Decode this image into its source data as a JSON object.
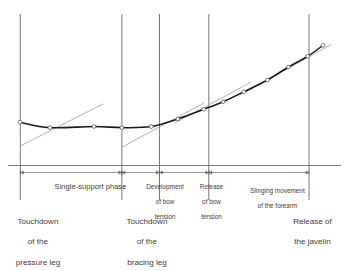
{
  "figure": {
    "colors": {
      "curve": "#1a1a1a",
      "tangent": "#9a9a9a",
      "axis": "#6b6b6b",
      "divider": "#6b6b6b",
      "text": "#3d3d3d",
      "marker_fill": "#ffffff",
      "background": "#ffffff"
    }
  },
  "chart_data": {
    "type": "line",
    "title": "",
    "xlabel": "",
    "ylabel": "",
    "xlim": [
      0,
      100
    ],
    "ylim": [
      0,
      100
    ],
    "grid": false,
    "legend": "none",
    "series": [
      {
        "name": "javelin velocity",
        "marker": "open-circle",
        "points": [
          {
            "x": 3.6,
            "y": 28.6
          },
          {
            "x": 12.6,
            "y": 25.0
          },
          {
            "x": 25.8,
            "y": 25.7
          },
          {
            "x": 34.2,
            "y": 25.0
          },
          {
            "x": 43.0,
            "y": 25.7
          },
          {
            "x": 51.0,
            "y": 30.7
          },
          {
            "x": 58.8,
            "y": 37.1
          },
          {
            "x": 64.6,
            "y": 42.1
          },
          {
            "x": 70.8,
            "y": 48.6
          },
          {
            "x": 77.9,
            "y": 56.4
          },
          {
            "x": 84.2,
            "y": 65.0
          },
          {
            "x": 90.0,
            "y": 72.1
          },
          {
            "x": 94.6,
            "y": 79.3
          }
        ]
      }
    ],
    "tangents": [
      {
        "name": "tangent-at-touchdown-pressure-leg",
        "x1": 3.7,
        "y1": 12.9,
        "x2": 28.6,
        "y2": 40.7
      },
      {
        "name": "tangent-at-touchdown-bracing-leg",
        "x1": 34.2,
        "y1": 12.1,
        "x2": 59.0,
        "y2": 41.4
      },
      {
        "name": "tangent-at-release-bow-tension",
        "x1": 50.0,
        "y1": 27.9,
        "x2": 73.0,
        "y2": 55.0
      },
      {
        "name": "tangent-at-slinging-movement",
        "x1": 69.6,
        "y1": 46.4,
        "x2": 97.1,
        "y2": 80.0
      }
    ],
    "event_lines": [
      {
        "name": "touchdown-pressure-leg",
        "x": 3.7
      },
      {
        "name": "touchdown-bracing-leg",
        "x": 34.2
      },
      {
        "name": "end-of-bow-development",
        "x": 45.5
      },
      {
        "name": "end-of-bow-release",
        "x": 60.3
      },
      {
        "name": "release-of-javelin",
        "x": 90.4
      }
    ]
  },
  "phases": [
    {
      "id": "single-support-phase",
      "label": "Single-support phase",
      "lines": [
        "Single-support phase"
      ],
      "start_event": "touchdown-pressure-leg",
      "end_event": "touchdown-bracing-leg"
    },
    {
      "id": "development-of-bow-tension",
      "label": "Development of bow tension",
      "lines": [
        "Development",
        "of bow",
        "tension"
      ],
      "start_event": "touchdown-bracing-leg",
      "end_event": "end-of-bow-development"
    },
    {
      "id": "release-of-bow-tension",
      "label": "Release of bow tension",
      "lines": [
        "Release",
        "of bow",
        "tension"
      ],
      "start_event": "end-of-bow-development",
      "end_event": "end-of-bow-release"
    },
    {
      "id": "slinging-movement-of-the-forearm",
      "label": "Slinging movement of the forearm",
      "lines": [
        "Slinging movement",
        "of the forearm"
      ],
      "start_event": "end-of-bow-release",
      "end_event": "release-of-javelin"
    }
  ],
  "event_captions": [
    {
      "id": "touchdown-of-the-pressure-leg",
      "lines": [
        "Touchdown",
        "of the",
        "pressure leg"
      ],
      "align": "center",
      "event": "touchdown-pressure-leg"
    },
    {
      "id": "touchdown-of-the-bracing-leg",
      "lines": [
        "Touchdown",
        "of the",
        "bracing leg"
      ],
      "align": "center",
      "event": "touchdown-bracing-leg"
    },
    {
      "id": "release-of-the-javelin",
      "lines": [
        "Release of",
        "the javelin"
      ],
      "align": "center",
      "event": "release-of-javelin"
    }
  ]
}
